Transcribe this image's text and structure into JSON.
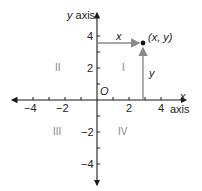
{
  "diagram": {
    "type": "cartesian-coordinate-plane",
    "axes": {
      "x_label_var": "x",
      "x_label_word": "axis",
      "y_label_var": "y",
      "y_label_word": "axis",
      "origin_label": "O",
      "x_ticks": [
        "−4",
        "−2",
        "2",
        "4"
      ],
      "y_ticks": [
        "4",
        "2",
        "−2",
        "−4"
      ]
    },
    "quadrants": {
      "I": "I",
      "II": "II",
      "III": "III",
      "IV": "IV"
    },
    "point": {
      "label": "(x, y)",
      "x_segment_label": "x",
      "y_segment_label": "y",
      "approx_coords": [
        2.9,
        3.6
      ]
    },
    "colors": {
      "axis": "#1a1a1a",
      "arrow": "#8a8a8a",
      "quadrant_label": "#888888"
    }
  }
}
